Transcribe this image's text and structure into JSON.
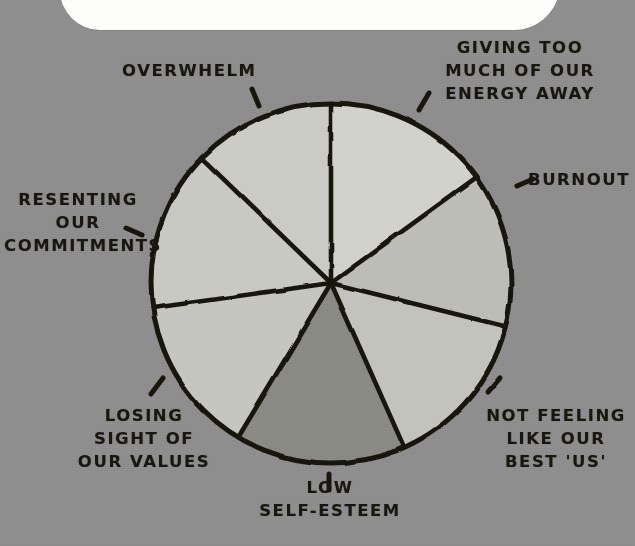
{
  "page": {
    "background_color": "#8e8e8e",
    "ink_color": "#17170f",
    "bubble_text": "DA"
  },
  "chart_data": {
    "type": "pie",
    "title": "",
    "subtitle": "",
    "xlabel": "",
    "ylabel": "",
    "legend_position": "callout-labels-around-pie",
    "grid": false,
    "center": {
      "x": 331,
      "y": 283
    },
    "radius": 180,
    "note": "Hand-drawn pie divided into 7 wedges; wedge values are angular spans in degrees read off the drawing. Fill tones are flat greys of differing lightness, darkest at 'LOW SELF-ESTEEM'.",
    "categories": [
      "GIVING TOO MUCH OF OUR ENERGY AWAY",
      "BURNOUT",
      "NOT FEELING LIKE OUR BEST 'US'",
      "LOW SELF-ESTEEM",
      "LOSING SIGHT OF OUR VALUES",
      "RESENTING OUR COMMITMENTS",
      "OVERWHELM"
    ],
    "values": [
      54,
      50,
      52,
      55,
      51,
      52,
      46
    ],
    "slices": [
      {
        "label": "GIVING TOO MUCH OF OUR ENERGY AWAY",
        "start_deg": -90,
        "end_deg": -36,
        "span_deg": 54,
        "color": "#d2d2cd",
        "tone": "lightest"
      },
      {
        "label": "BURNOUT",
        "start_deg": -36,
        "end_deg": 14,
        "span_deg": 50,
        "color": "#bdbdb8",
        "tone": "light"
      },
      {
        "label": "NOT FEELING LIKE OUR BEST 'US'",
        "start_deg": 14,
        "end_deg": 66,
        "span_deg": 52,
        "color": "#c3c3be",
        "tone": "light"
      },
      {
        "label": "LOW SELF-ESTEEM",
        "start_deg": 66,
        "end_deg": 121,
        "span_deg": 55,
        "color": "#8a8a85",
        "tone": "darkest"
      },
      {
        "label": "LOSING SIGHT OF OUR VALUES",
        "start_deg": 121,
        "end_deg": 172,
        "span_deg": 51,
        "color": "#c6c6c1",
        "tone": "light"
      },
      {
        "label": "RESENTING OUR COMMITMENTS",
        "start_deg": 172,
        "end_deg": 224,
        "span_deg": 52,
        "color": "#c9c9c4",
        "tone": "light"
      },
      {
        "label": "OVERWHELM",
        "start_deg": 224,
        "end_deg": 270,
        "span_deg": 46,
        "color": "#cbcbc6",
        "tone": "light"
      }
    ],
    "labels": [
      {
        "name": "giving-energy-away",
        "text": "GIVING TOO\nMUCH OF OUR\nENERGY AWAY"
      },
      {
        "name": "burnout",
        "text": "BURNOUT"
      },
      {
        "name": "not-best-us",
        "text": "NOT FEELING\nLIKE OUR\nBEST 'US'"
      },
      {
        "name": "low-self-esteem",
        "text": "LOW\nSELF-ESTEEM"
      },
      {
        "name": "losing-values",
        "text": "LOSING\nSIGHT OF\nOUR VALUES"
      },
      {
        "name": "resenting",
        "text": "RESENTING\nOUR\nCOMMITMENTS"
      },
      {
        "name": "overwhelm",
        "text": "OVERWHELM"
      }
    ]
  }
}
